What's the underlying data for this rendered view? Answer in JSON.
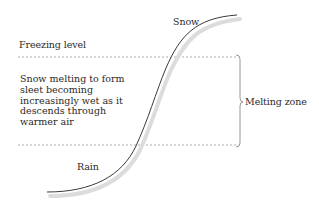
{
  "diagram": {
    "labels": {
      "snow": "Snow",
      "freezing_level": "Freezing level",
      "rain": "Rain",
      "melting_zone": "Melting zone"
    },
    "description": {
      "lines": [
        "Snow melting to form",
        "sleet becoming",
        "increasingly wet as it",
        "descends through",
        "warmer air"
      ]
    },
    "colors": {
      "curve": "#3a3a3a",
      "curve_shadow": "#d8d8d8",
      "dashed_line": "#9a9a9a",
      "bracket": "#8a8a8a",
      "text": "#2a2a2a",
      "background": "#ffffff"
    }
  }
}
